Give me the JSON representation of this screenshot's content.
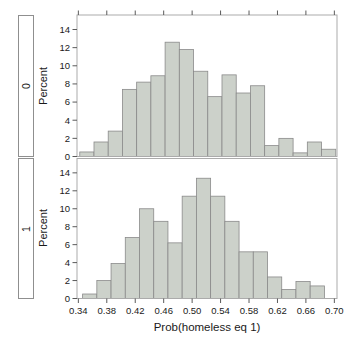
{
  "chart_data": {
    "type": "bar",
    "subtype": "histogram",
    "layout": "two vertically stacked trellis panels sharing the x axis, row strips on the left",
    "title": "",
    "xlabel": "Prob(homeless eq 1)",
    "ylabel": "Percent",
    "x_tick_labels": [
      "0.34",
      "0.38",
      "0.42",
      "0.46",
      "0.50",
      "0.54",
      "0.58",
      "0.62",
      "0.66",
      "0.70"
    ],
    "x_ticks": [
      0.34,
      0.38,
      0.42,
      0.46,
      0.5,
      0.54,
      0.58,
      0.62,
      0.66,
      0.7
    ],
    "y_ticks": [
      0,
      2,
      4,
      6,
      8,
      10,
      12,
      14
    ],
    "ylim": [
      0,
      15.6
    ],
    "xlim": [
      0.338,
      0.705
    ],
    "bin_width": 0.02,
    "grid": false,
    "legend": "none",
    "panels": [
      {
        "strip_label": "0",
        "first_bin_left_edge": 0.342,
        "percent_values": [
          0.5,
          1.6,
          2.8,
          7.4,
          8.2,
          8.9,
          12.6,
          11.8,
          9.4,
          6.6,
          9.0,
          7.0,
          7.8,
          1.2,
          2.0,
          0.4,
          1.6,
          0.8
        ]
      },
      {
        "strip_label": "1",
        "first_bin_left_edge": 0.346,
        "percent_values": [
          0.5,
          2.0,
          3.9,
          6.8,
          10.0,
          8.6,
          6.2,
          11.4,
          13.4,
          11.4,
          8.6,
          5.2,
          5.2,
          2.4,
          1.0,
          1.9,
          1.4
        ]
      }
    ]
  },
  "style": {
    "background": "#ffffff",
    "bar_fill": "#ccd1ca",
    "bar_stroke": "#8a8a8a",
    "panel_border": "#ababab",
    "strip_border": "#8f8f8f",
    "tick_color": "#5a5a5a",
    "text_color": "#1a1a1a"
  }
}
